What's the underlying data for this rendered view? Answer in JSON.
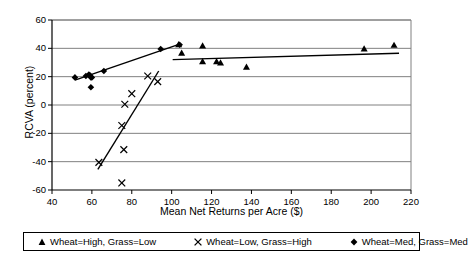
{
  "chart_data": {
    "type": "scatter",
    "title": "",
    "xlabel": "Mean Net Returns per Acre ($)",
    "ylabel": "RCVA (percent)",
    "xlim": [
      40,
      220
    ],
    "ylim": [
      -60,
      60
    ],
    "xticks": [
      40,
      60,
      80,
      100,
      120,
      140,
      160,
      180,
      200,
      220
    ],
    "yticks": [
      -60,
      -40,
      -20,
      0,
      20,
      40,
      60
    ],
    "grid": "horizontal",
    "legend_position": "bottom",
    "series": [
      {
        "name": "Wheat=High, Grass=Low",
        "marker": "triangle",
        "color": "#000000",
        "points": [
          [
            103.5,
            42.5
          ],
          [
            105.0,
            36.5
          ],
          [
            115.5,
            41.5
          ],
          [
            115.5,
            30.5
          ],
          [
            122.5,
            30.5
          ],
          [
            124.5,
            29.5
          ],
          [
            137.5,
            26.5
          ],
          [
            196.5,
            39.5
          ],
          [
            211.5,
            42.0
          ]
        ],
        "trendline": [
          [
            100.5,
            32.0
          ],
          [
            214.0,
            36.5
          ]
        ]
      },
      {
        "name": "Wheat=Low, Grass=High",
        "marker": "x",
        "color": "#000000",
        "points": [
          [
            63.5,
            -40.5
          ],
          [
            75.0,
            -55.0
          ],
          [
            76.0,
            -31.5
          ],
          [
            75.0,
            -14.5
          ],
          [
            76.5,
            0.5
          ],
          [
            80.0,
            8.0
          ],
          [
            88.0,
            20.5
          ],
          [
            93.0,
            16.5
          ]
        ],
        "trendline": [
          [
            63.0,
            -45.5
          ],
          [
            93.5,
            24.0
          ]
        ]
      },
      {
        "name": "Wheat=Med, Grass=Med",
        "marker": "diamond",
        "color": "#000000",
        "points": [
          [
            51.5,
            19.5
          ],
          [
            57.0,
            20.5
          ],
          [
            58.5,
            21.5
          ],
          [
            59.0,
            21.0
          ],
          [
            59.5,
            19.5
          ],
          [
            60.0,
            19.5
          ],
          [
            59.5,
            12.5
          ],
          [
            66.0,
            24.0
          ],
          [
            94.5,
            39.5
          ],
          [
            104.0,
            42.5
          ]
        ],
        "trendline": [
          [
            51.5,
            17.5
          ],
          [
            104.0,
            43.0
          ]
        ]
      }
    ]
  },
  "axes": {
    "x_tick_labels": [
      "40",
      "60",
      "80",
      "100",
      "120",
      "140",
      "160",
      "180",
      "200",
      "220"
    ],
    "y_tick_labels": [
      "60",
      "40",
      "20",
      "0",
      "-20",
      "-40",
      "-60"
    ],
    "x_title": "Mean Net Returns per Acre ($)",
    "y_title": "RCVA (percent)"
  },
  "legend": {
    "entries": [
      {
        "marker": "triangle-marker",
        "label": "Wheat=High, Grass=Low"
      },
      {
        "marker": "x-marker",
        "label": "Wheat=Low, Grass=High"
      },
      {
        "marker": "diamond-marker",
        "label": "Wheat=Med, Grass=Med"
      }
    ]
  },
  "style": {
    "axis_color": "#000000",
    "grid_color": "#808080",
    "marker_color": "#000000",
    "plot_background": "#ffffff"
  }
}
